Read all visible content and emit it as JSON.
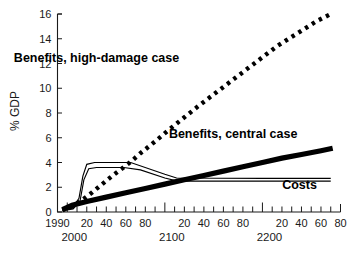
{
  "chart_data": {
    "type": "line",
    "title": "",
    "subtitle": "",
    "xlabel": "",
    "ylabel": "% GDP",
    "xlim": [
      1990,
      2280
    ],
    "ylim": [
      0,
      16
    ],
    "grid": false,
    "legend_position": "inline-annotations",
    "y_ticks": [
      0,
      2,
      4,
      6,
      8,
      10,
      12,
      14,
      16
    ],
    "y_tick_labels": [
      "0",
      "2",
      "4",
      "6",
      "8",
      "10",
      "12",
      "14",
      "16"
    ],
    "x_ticks": [
      1990,
      2000,
      2010,
      2020,
      2030,
      2040,
      2050,
      2060,
      2070,
      2080,
      2090,
      2100,
      2110,
      2120,
      2130,
      2140,
      2150,
      2160,
      2170,
      2180,
      2190,
      2200,
      2210,
      2220,
      2230,
      2240,
      2250,
      2260,
      2270,
      2280
    ],
    "x_tick_labels": [
      {
        "value": 1990,
        "label": "1990",
        "kind": "decade"
      },
      {
        "value": 2000,
        "label": "",
        "kind": "century"
      },
      {
        "value": 2020,
        "label": "20",
        "kind": "decade"
      },
      {
        "value": 2040,
        "label": "40",
        "kind": "decade"
      },
      {
        "value": 2060,
        "label": "60",
        "kind": "decade"
      },
      {
        "value": 2080,
        "label": "80",
        "kind": "decade"
      },
      {
        "value": 2100,
        "label": "",
        "kind": "century"
      },
      {
        "value": 2120,
        "label": "20",
        "kind": "decade"
      },
      {
        "value": 2140,
        "label": "40",
        "kind": "decade"
      },
      {
        "value": 2160,
        "label": "60",
        "kind": "decade"
      },
      {
        "value": 2180,
        "label": "80",
        "kind": "decade"
      },
      {
        "value": 2200,
        "label": "",
        "kind": "century"
      },
      {
        "value": 2220,
        "label": "20",
        "kind": "decade"
      },
      {
        "value": 2240,
        "label": "40",
        "kind": "decade"
      },
      {
        "value": 2260,
        "label": "60",
        "kind": "decade"
      },
      {
        "value": 2280,
        "label": "80",
        "kind": "decade"
      }
    ],
    "era_labels": [
      {
        "value": 2000,
        "label": "2000"
      },
      {
        "value": 2100,
        "label": "2100"
      },
      {
        "value": 2200,
        "label": "2200"
      }
    ],
    "series": [
      {
        "name": "Benefits, high-damage case",
        "style": "dotted",
        "label": "Benefits, high-damage case",
        "points": [
          [
            1995,
            0.15
          ],
          [
            2005,
            0.45
          ],
          [
            2015,
            0.95
          ],
          [
            2025,
            1.55
          ],
          [
            2035,
            2.2
          ],
          [
            2045,
            2.85
          ],
          [
            2055,
            3.45
          ],
          [
            2065,
            4.05
          ],
          [
            2075,
            4.75
          ],
          [
            2090,
            5.7
          ],
          [
            2105,
            6.7
          ],
          [
            2120,
            7.65
          ],
          [
            2135,
            8.6
          ],
          [
            2150,
            9.5
          ],
          [
            2165,
            10.4
          ],
          [
            2180,
            11.3
          ],
          [
            2195,
            12.2
          ],
          [
            2215,
            13.4
          ],
          [
            2235,
            14.4
          ],
          [
            2255,
            15.4
          ],
          [
            2270,
            16.0
          ]
        ]
      },
      {
        "name": "Benefits, central case",
        "style": "thick",
        "label": "Benefits, central case",
        "points": [
          [
            1995,
            0.2
          ],
          [
            2005,
            0.55
          ],
          [
            2020,
            0.85
          ],
          [
            2040,
            1.2
          ],
          [
            2060,
            1.55
          ],
          [
            2080,
            1.9
          ],
          [
            2100,
            2.25
          ],
          [
            2120,
            2.6
          ],
          [
            2140,
            2.95
          ],
          [
            2160,
            3.3
          ],
          [
            2180,
            3.65
          ],
          [
            2200,
            4.0
          ],
          [
            2220,
            4.35
          ],
          [
            2240,
            4.65
          ],
          [
            2260,
            4.95
          ],
          [
            2272,
            5.15
          ]
        ]
      },
      {
        "name": "Costs (upper bound)",
        "style": "thin",
        "label": "Costs",
        "points": [
          [
            1995,
            0.15
          ],
          [
            2005,
            0.3
          ],
          [
            2012,
            1.1
          ],
          [
            2016,
            2.9
          ],
          [
            2020,
            3.85
          ],
          [
            2028,
            4.0
          ],
          [
            2065,
            4.0
          ],
          [
            2100,
            3.05
          ],
          [
            2112,
            2.75
          ],
          [
            2200,
            2.72
          ],
          [
            2270,
            2.72
          ]
        ]
      },
      {
        "name": "Costs (lower bound)",
        "style": "thin",
        "label": "",
        "points": [
          [
            1995,
            0.1
          ],
          [
            2006,
            0.25
          ],
          [
            2013,
            0.85
          ],
          [
            2017,
            2.6
          ],
          [
            2022,
            3.5
          ],
          [
            2030,
            3.6
          ],
          [
            2058,
            3.6
          ],
          [
            2075,
            3.4
          ],
          [
            2100,
            2.75
          ],
          [
            2113,
            2.5
          ],
          [
            2200,
            2.5
          ],
          [
            2270,
            2.5
          ]
        ]
      }
    ],
    "annotations": [
      {
        "text": "Benefits, high-damage case",
        "x": 2030,
        "y": 12.1
      },
      {
        "text": "Benefits, central case",
        "x": 2170,
        "y": 5.95
      },
      {
        "text": "Costs",
        "x": 2238,
        "y": 1.85
      }
    ],
    "colors": {
      "line": "#000000",
      "axis": "#1a1a1a",
      "background": "#ffffff",
      "text": "#1a1a1a"
    }
  }
}
